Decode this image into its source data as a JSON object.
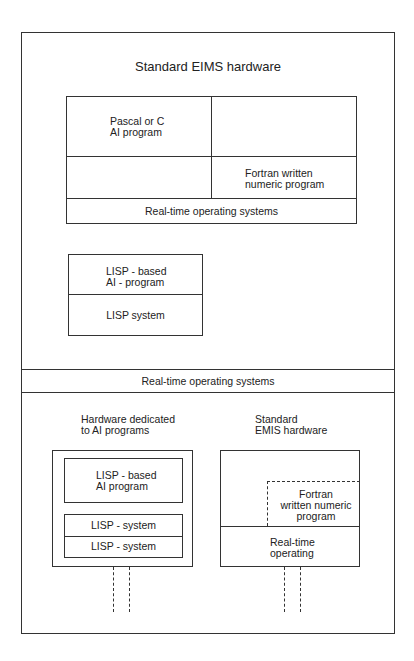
{
  "top_section": {
    "title": "Standard EIMS hardware",
    "grid": {
      "cell_top_left": [
        "Pascal or C",
        "AI program"
      ],
      "cell_bottom_right": [
        "Fortran written",
        "numeric program"
      ],
      "footer": "Real-time operating systems"
    },
    "lisp_box": {
      "program": [
        "LISP - based",
        "AI - program"
      ],
      "system": "LISP system"
    }
  },
  "middle_band": {
    "label": "Real-time operating systems"
  },
  "bottom_section": {
    "left": {
      "caption": [
        "Hardware dedicated",
        "to AI programs"
      ],
      "program": [
        "LISP - based",
        "AI program"
      ],
      "systems": [
        "LISP - system",
        "LISP - system"
      ]
    },
    "right": {
      "caption": [
        "Standard",
        "EMIS hardware"
      ],
      "program": [
        "Fortran",
        "written numeric",
        "program"
      ],
      "os": [
        "Real-time",
        "operating"
      ]
    }
  },
  "colors": {
    "line": "#333333",
    "background": "#ffffff"
  }
}
